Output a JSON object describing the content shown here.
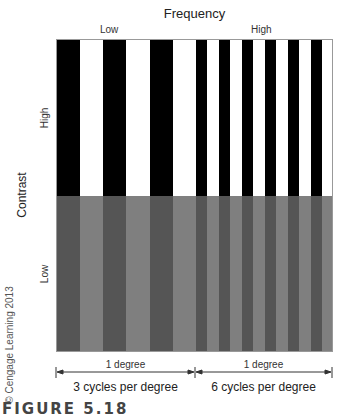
{
  "figure": {
    "title": "Frequency",
    "frequency_labels": {
      "low": "Low",
      "high": "High"
    },
    "axis_label": "Contrast",
    "contrast_labels": {
      "high": "High",
      "low": "Low"
    },
    "copyright": "© Cengage Learning 2013",
    "scale": {
      "left": {
        "span": "1 degree",
        "caption": "3 cycles per degree"
      },
      "right": {
        "span": "1 degree",
        "caption": "6 cycles per degree"
      }
    },
    "caption_word": "FIGURE",
    "caption_number": "5.18"
  },
  "colors": {
    "high_dark": "#000000",
    "high_light": "#ffffff",
    "low_dark": "#555555",
    "low_light": "#7f7f7f"
  },
  "gratings": {
    "low_frequency": {
      "cycles": 3,
      "x_start": 0,
      "width": 139
    },
    "high_frequency": {
      "cycles": 6,
      "x_start": 139,
      "width": 138
    }
  }
}
